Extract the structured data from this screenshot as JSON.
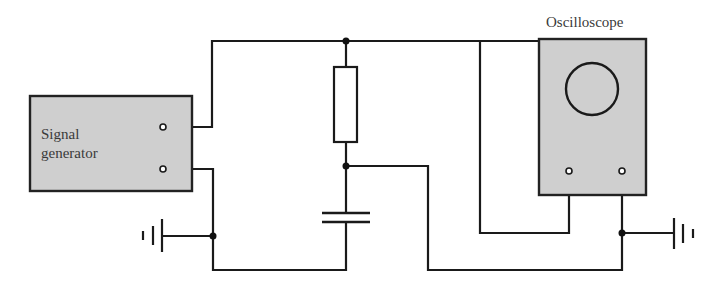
{
  "diagram": {
    "type": "circuit",
    "components": {
      "signal_generator": {
        "label_line1": "Signal",
        "label_line2": "generator"
      },
      "oscilloscope": {
        "label": "Oscilloscope"
      },
      "resistor": {
        "label": ""
      },
      "capacitor": {
        "label": ""
      },
      "ground_left": {
        "label": ""
      },
      "ground_right": {
        "label": ""
      }
    },
    "colors": {
      "wire": "#1a1a1a",
      "device_fill": "#cfcfcf",
      "device_border": "#222222",
      "text": "#3a3a3a",
      "background": "#ffffff"
    }
  }
}
